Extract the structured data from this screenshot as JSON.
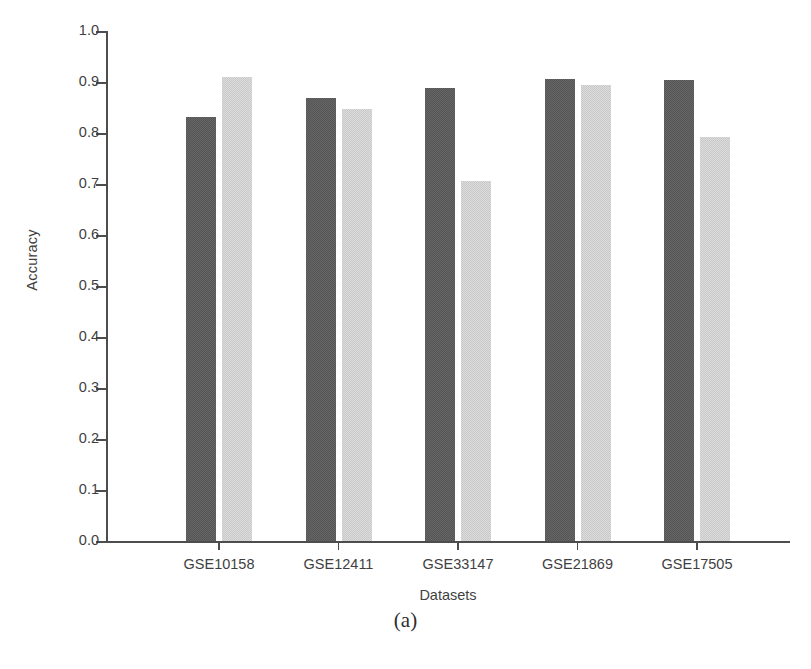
{
  "figure": {
    "caption": "(a)"
  },
  "chart_data": {
    "type": "bar",
    "title": "",
    "xlabel": "Datasets",
    "ylabel": "Accuracy",
    "categories": [
      "GSE10158",
      "GSE12411",
      "GSE33147",
      "GSE21869",
      "GSE17505"
    ],
    "series": [
      {
        "name": "series-1",
        "color": "#555555",
        "values": [
          0.831,
          0.869,
          0.888,
          0.906,
          0.903
        ]
      },
      {
        "name": "series-2",
        "color": "#c9c9c9",
        "values": [
          0.91,
          0.847,
          0.705,
          0.894,
          0.793
        ]
      }
    ],
    "ylim": [
      0.0,
      1.0
    ],
    "ytick_labels": [
      "0.0",
      "0.1",
      "0.2",
      "0.3",
      "0.4",
      "0.5",
      "0.6",
      "0.7",
      "0.8",
      "0.9",
      "1.0"
    ],
    "ytick_values": [
      0.0,
      0.1,
      0.2,
      0.3,
      0.4,
      0.5,
      0.6,
      0.7,
      0.8,
      0.9,
      1.0
    ],
    "grid": false,
    "legend": "none",
    "background": "#ffffff"
  }
}
